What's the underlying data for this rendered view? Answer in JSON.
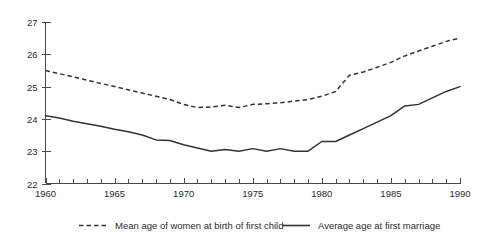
{
  "chart_data": {
    "type": "line",
    "title": "",
    "subtitle": "",
    "xlabel": "",
    "ylabel": "",
    "xlim": [
      1960,
      1990
    ],
    "ylim": [
      22,
      27
    ],
    "grid": false,
    "legend_position": "bottom",
    "y_ticks": [
      "22",
      "23",
      "24",
      "25",
      "26",
      "27"
    ],
    "y_tick_values": [
      22,
      23,
      24,
      25,
      26,
      27
    ],
    "x_ticks": [
      "1960",
      "1965",
      "1970",
      "1975",
      "1980",
      "1985",
      "1990"
    ],
    "x_tick_values": [
      1960,
      1965,
      1970,
      1975,
      1980,
      1985,
      1990
    ],
    "x_minor_tick_step": 1,
    "x": [
      1960,
      1961,
      1962,
      1963,
      1964,
      1965,
      1966,
      1967,
      1968,
      1969,
      1970,
      1971,
      1972,
      1973,
      1974,
      1975,
      1976,
      1977,
      1978,
      1979,
      1980,
      1981,
      1982,
      1983,
      1984,
      1985,
      1986,
      1987,
      1988,
      1989,
      1990
    ],
    "series": [
      {
        "name": "Mean age of women at birth of first child",
        "style": "dashed",
        "color": "#333333",
        "values": [
          25.5,
          25.4,
          25.3,
          25.2,
          25.1,
          25.0,
          24.9,
          24.8,
          24.7,
          24.6,
          24.45,
          24.35,
          24.37,
          24.42,
          24.35,
          24.45,
          24.47,
          24.5,
          24.55,
          24.6,
          24.7,
          24.85,
          25.35,
          25.45,
          25.6,
          25.75,
          25.95,
          26.1,
          26.25,
          26.4,
          26.5
        ]
      },
      {
        "name": "Average age at first marriage",
        "style": "solid",
        "color": "#333333",
        "values": [
          24.1,
          24.03,
          23.93,
          23.85,
          23.77,
          23.68,
          23.6,
          23.5,
          23.35,
          23.33,
          23.2,
          23.1,
          23.0,
          23.05,
          23.0,
          23.08,
          23.0,
          23.08,
          23.0,
          23.0,
          23.3,
          23.3,
          23.5,
          23.7,
          23.9,
          24.1,
          24.4,
          24.45,
          24.65,
          24.85,
          25.0
        ]
      }
    ]
  },
  "legend": {
    "entries": [
      {
        "label": "Mean age of women at birth of first child",
        "style": "dashed"
      },
      {
        "label": "Average age at first marriage",
        "style": "solid"
      }
    ]
  },
  "colors": {
    "background": "#ffffff",
    "axis": "#4a4a4a",
    "line": "#333333",
    "text": "#2b2b2b"
  }
}
